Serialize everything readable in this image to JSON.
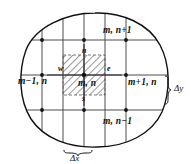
{
  "figure": {
    "name": "finite-difference-grid-control-volume",
    "background_color": "#ffffff",
    "line_color": "#111111",
    "hatch_color": "#444444",
    "nodes": [
      {
        "id": "m-n-plus-1",
        "label": "m, n+1",
        "x": 84,
        "y": 40
      },
      {
        "id": "m-minus-1-n",
        "label": "m−1, n",
        "x": 42,
        "y": 75
      },
      {
        "id": "m-n",
        "label": "m, n",
        "x": 84,
        "y": 75
      },
      {
        "id": "m-plus-1-n",
        "label": "m+1, n",
        "x": 126,
        "y": 75
      },
      {
        "id": "m-n-minus-1",
        "label": "m, n−1",
        "x": 84,
        "y": 110
      }
    ],
    "faces": [
      {
        "id": "north",
        "label": "n",
        "x": 84,
        "y": 52
      },
      {
        "id": "west",
        "label": "w",
        "x": 62,
        "y": 70
      },
      {
        "id": "east",
        "label": "e",
        "x": 107,
        "y": 70
      },
      {
        "id": "south",
        "label": "s",
        "x": 84,
        "y": 99
      }
    ],
    "dimensions": [
      {
        "id": "delta-y",
        "label": "Δy"
      },
      {
        "id": "delta-x",
        "label": "Δx"
      }
    ],
    "grid": {
      "vertical_lines_x": [
        42,
        63,
        84,
        105,
        126
      ],
      "horizontal_lines_y": [
        40,
        75,
        110
      ],
      "spacing_dx": 21,
      "spacing_dy": 35
    },
    "control_volume": {
      "id": "hatched-control-volume",
      "left": 63,
      "top": 55,
      "right": 105,
      "bottom": 95
    }
  }
}
